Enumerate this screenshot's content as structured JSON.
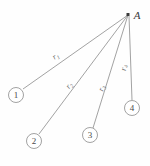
{
  "figure": {
    "background_color": "#fefefe",
    "line_color": "#8a8a8a",
    "text_color": "#4a4a4a",
    "width": 150,
    "height": 166
  },
  "apex": {
    "name": "A",
    "label": "A",
    "point_x": 128,
    "point_y": 15,
    "label_x": 137,
    "label_y": 19
  },
  "nodes": [
    {
      "id": "1",
      "label": "1",
      "cx": 16,
      "cy": 95,
      "r": 7.5
    },
    {
      "id": "2",
      "label": "2",
      "cx": 34,
      "cy": 141,
      "r": 7.5
    },
    {
      "id": "3",
      "label": "3",
      "cx": 90,
      "cy": 135,
      "r": 7.5
    },
    {
      "id": "4",
      "label": "4",
      "cx": 132,
      "cy": 108,
      "r": 7.5
    }
  ],
  "segments": [
    {
      "id": "r1",
      "label": "r",
      "subscript": "1",
      "from": "A",
      "to": "1",
      "x1": 128,
      "y1": 15,
      "x2": 23,
      "y2": 89,
      "label_x": 57,
      "label_y": 58,
      "label_rotation": -35
    },
    {
      "id": "r2",
      "label": "r",
      "subscript": "2",
      "from": "A",
      "to": "2",
      "x1": 128,
      "y1": 15,
      "x2": 39,
      "y2": 134,
      "label_x": 71,
      "label_y": 87,
      "label_rotation": -53
    },
    {
      "id": "r3",
      "label": "r",
      "subscript": "3",
      "from": "A",
      "to": "3",
      "x1": 128,
      "y1": 15,
      "x2": 93,
      "y2": 128,
      "label_x": 104,
      "label_y": 89,
      "label_rotation": -72
    },
    {
      "id": "r4",
      "label": "r",
      "subscript": "4",
      "from": "A",
      "to": "4",
      "x1": 129,
      "y1": 16,
      "x2": 132,
      "y2": 100,
      "label_x": 126,
      "label_y": 68,
      "label_rotation": -84
    }
  ]
}
